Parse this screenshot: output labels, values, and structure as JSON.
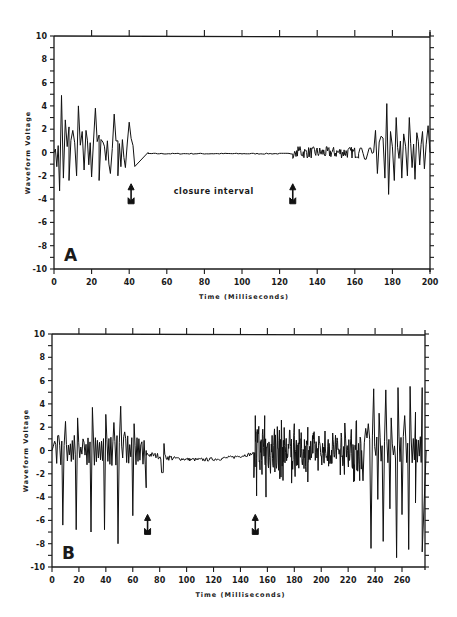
{
  "chart_data": [
    {
      "id": "A",
      "type": "line",
      "panel_label": "A",
      "xlabel": "Time (Milliseconds)",
      "ylabel": "Waveform Voltage",
      "xlim": [
        0,
        200
      ],
      "ylim": [
        -10,
        10
      ],
      "xticks": [
        0,
        20,
        40,
        60,
        80,
        100,
        120,
        140,
        160,
        180,
        200
      ],
      "yticks": [
        10,
        8,
        6,
        4,
        2,
        0,
        -2,
        -4,
        -6,
        -8,
        -10
      ],
      "grid": false,
      "annotations": [
        {
          "text": "closure interval",
          "x": 85,
          "y": -3.6
        },
        {
          "type": "arrow",
          "x": 41,
          "label": "closure start"
        },
        {
          "type": "arrow",
          "x": 127,
          "label": "closure end"
        }
      ],
      "series": [
        {
          "name": "waveform",
          "segments": [
            {
              "x_start": 0,
              "x_end": 50,
              "kind": "oscillation",
              "peak_max": 4.9,
              "trough_min": -3.3,
              "peaks": [
                [
                  4,
                  4.9
                ],
                [
                  6,
                  2.8
                ],
                [
                  8,
                  2.2
                ],
                [
                  10,
                  1.9
                ],
                [
                  13,
                  4.0
                ],
                [
                  15,
                  1.8
                ],
                [
                  17,
                  1.9
                ],
                [
                  22,
                  3.8
                ],
                [
                  24,
                  1.5
                ],
                [
                  26,
                  0.9
                ],
                [
                  32,
                  3.3
                ],
                [
                  34,
                  1.0
                ],
                [
                  40,
                  2.6
                ],
                [
                  42,
                  0.6
                ]
              ],
              "troughs": [
                [
                  3,
                  -3.3
                ],
                [
                  5,
                  -2.2
                ],
                [
                  8,
                  -2.4
                ],
                [
                  12,
                  -2.0
                ],
                [
                  16,
                  -1.5
                ],
                [
                  20,
                  -2.1
                ],
                [
                  24,
                  -2.4
                ],
                [
                  30,
                  -1.8
                ],
                [
                  34,
                  -2.0
                ],
                [
                  38,
                  -1.3
                ],
                [
                  43,
                  -1.2
                ]
              ]
            },
            {
              "x_start": 50,
              "x_end": 127,
              "kind": "flat",
              "level": -0.1
            },
            {
              "x_start": 127,
              "x_end": 162,
              "kind": "low-amplitude noise",
              "amplitude": 0.5
            },
            {
              "x_start": 162,
              "x_end": 170,
              "kind": "transition",
              "peak": 0.6,
              "trough": -0.6
            },
            {
              "x_start": 170,
              "x_end": 200,
              "kind": "oscillation",
              "peak_max": 4.2,
              "trough_min": -3.6,
              "peaks": [
                [
                  171,
                  1.9
                ],
                [
                  174,
                  1.4
                ],
                [
                  177,
                  4.2
                ],
                [
                  179,
                  1.8
                ],
                [
                  182,
                  3.0
                ],
                [
                  186,
                  1.6
                ],
                [
                  189,
                  3.0
                ],
                [
                  193,
                  1.7
                ],
                [
                  196,
                  1.8
                ],
                [
                  199,
                  2.3
                ]
              ],
              "troughs": [
                [
                  172,
                  -1.8
                ],
                [
                  176,
                  -2.2
                ],
                [
                  178,
                  -3.6
                ],
                [
                  181,
                  -2.4
                ],
                [
                  185,
                  -2.2
                ],
                [
                  188,
                  -2.0
                ],
                [
                  192,
                  -2.3
                ],
                [
                  197,
                  -1.4
                ]
              ]
            }
          ]
        }
      ]
    },
    {
      "id": "B",
      "type": "line",
      "panel_label": "B",
      "xlabel": "Time (Milliseconds)",
      "ylabel": "Waveform Voltage",
      "xlim": [
        0,
        278
      ],
      "ylim": [
        -10,
        10
      ],
      "xticks": [
        0,
        20,
        40,
        60,
        80,
        100,
        120,
        140,
        160,
        180,
        200,
        220,
        240,
        260
      ],
      "yticks": [
        10,
        8,
        6,
        4,
        2,
        0,
        -2,
        -4,
        -6,
        -8,
        -10
      ],
      "grid": false,
      "annotations": [
        {
          "type": "arrow",
          "x": 71,
          "label": "closure start"
        },
        {
          "type": "arrow",
          "x": 151,
          "label": "closure end"
        }
      ],
      "series": [
        {
          "name": "waveform",
          "segments": [
            {
              "x_start": 0,
              "x_end": 70,
              "kind": "oscillation",
              "peak_max": 3.8,
              "trough_min": -8.0,
              "peaks": [
                [
                  2,
                  0.8
                ],
                [
                  5,
                  1.3
                ],
                [
                  10,
                  2.5
                ],
                [
                  19,
                  2.8
                ],
                [
                  23,
                  1.0
                ],
                [
                  30,
                  3.7
                ],
                [
                  40,
                  3.1
                ],
                [
                  46,
                  2.4
                ],
                [
                  51,
                  3.8
                ],
                [
                  54,
                  1.6
                ],
                [
                  61,
                  2.3
                ],
                [
                  66,
                  0.5
                ]
              ],
              "troughs": [
                [
                  8,
                  -6.4
                ],
                [
                  18,
                  -6.8
                ],
                [
                  29,
                  -7.0
                ],
                [
                  39,
                  -6.8
                ],
                [
                  49,
                  -8.0
                ],
                [
                  60,
                  -5.6
                ],
                [
                  70,
                  -3.2
                ]
              ]
            },
            {
              "x_start": 70,
              "x_end": 150,
              "kind": "slow drift",
              "level_start": -0.3,
              "level_mid": -0.8,
              "level_end": -0.2,
              "note": "small transient at x≈82 to -1.9"
            },
            {
              "x_start": 150,
              "x_end": 230,
              "kind": "dense noise",
              "peak_max": 3.0,
              "trough_min": -4.0,
              "peaks": [
                [
                  151,
                  3.0
                ],
                [
                  158,
                  3.0
                ],
                [
                  180,
                  2.3
                ],
                [
                  190,
                  2.0
                ]
              ],
              "troughs": [
                [
                  152,
                  -3.9
                ],
                [
                  159,
                  -4.0
                ],
                [
                  178,
                  -2.8
                ],
                [
                  190,
                  -2.7
                ]
              ]
            },
            {
              "x_start": 230,
              "x_end": 278,
              "kind": "oscillation",
              "peak_max": 5.5,
              "trough_min": -9.2,
              "peaks": [
                [
                  233,
                  1.9
                ],
                [
                  235,
                  2.3
                ],
                [
                  239,
                  5.3
                ],
                [
                  243,
                  3.2
                ],
                [
                  248,
                  5.2
                ],
                [
                  252,
                  2.8
                ],
                [
                  257,
                  5.4
                ],
                [
                  262,
                  3.0
                ],
                [
                  266,
                  5.5
                ],
                [
                  270,
                  3.3
                ],
                [
                  275,
                  5.4
                ]
              ],
              "troughs": [
                [
                  231,
                  -2.6
                ],
                [
                  237,
                  -8.4
                ],
                [
                  242,
                  -4.2
                ],
                [
                  246,
                  -7.8
                ],
                [
                  251,
                  -5.0
                ],
                [
                  256,
                  -9.2
                ],
                [
                  260,
                  -5.5
                ],
                [
                  265,
                  -8.5
                ],
                [
                  270,
                  -4.5
                ],
                [
                  275,
                  -8.7
                ]
              ]
            }
          ]
        }
      ]
    }
  ]
}
